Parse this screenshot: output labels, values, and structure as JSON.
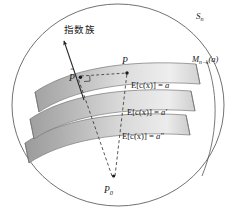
{
  "figure": {
    "name": "exponential-family-manifold-foliation-diagram",
    "background_color": "#ffffff",
    "outline_color": "#555555",
    "ink_color": "#1a1a1a"
  },
  "labels": {
    "ambient_space": "S",
    "ambient_space_sub": "n",
    "submanifold": "M",
    "submanifold_sub": "n−k",
    "submanifold_arg": "(a)",
    "exponential_family_cjk": "指数族",
    "point_p": "P",
    "point_p_hat": "P",
    "point_p_hat_accent": "ˆ",
    "point_p0": "P",
    "point_p0_sub": "0"
  },
  "level_sets": [
    {
      "name": "level-set-a",
      "lhs": "E[c(x)] =",
      "rhs": "a",
      "prime": ""
    },
    {
      "name": "level-set-a-prime",
      "lhs": "E[c(x)] =",
      "rhs": "a",
      "prime": "′"
    },
    {
      "name": "level-set-a-dprime",
      "lhs": "E[c(x)] =",
      "rhs": "a",
      "prime": "″"
    }
  ],
  "bands": {
    "count": 3,
    "fill_dark": "#a9a9a9",
    "fill_light": "#efefef",
    "edge_color": "#7d7d7d"
  },
  "arrow": {
    "name": "exponential-family-direction-arrow",
    "color": "#262626"
  },
  "dashed_lines": {
    "color": "#3a3a3a",
    "description": "geodesic projection lines from P0 to P and P-hat, plus horizontal link P-hat to P"
  }
}
